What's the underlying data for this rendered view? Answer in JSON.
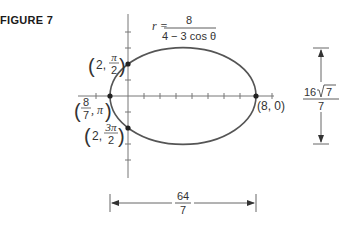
{
  "figure": {
    "label": "FIGURE 7",
    "equation": {
      "lhs": "r =",
      "numerator": "8",
      "denominator": "4 − 3 cos θ"
    },
    "points": [
      {
        "id": "top",
        "paren_left": "(",
        "a": "2,",
        "num": "π",
        "den": "2",
        "paren_right": ")"
      },
      {
        "id": "left",
        "paren_left": "(",
        "num": "8",
        "den": "7",
        "b": ", π",
        "paren_right": ")"
      },
      {
        "id": "bottom",
        "paren_left": "(",
        "a": "2,",
        "num": "3π",
        "den": "2",
        "paren_right": ")"
      },
      {
        "id": "right",
        "text": "(8, 0)"
      }
    ],
    "dimensions": {
      "major": {
        "num": "64",
        "den": "7"
      },
      "minor": {
        "num": "16",
        "sqrt": "7",
        "den": "7"
      }
    },
    "colors": {
      "curve": "#555555",
      "axis": "#777777",
      "text": "#333333"
    }
  }
}
